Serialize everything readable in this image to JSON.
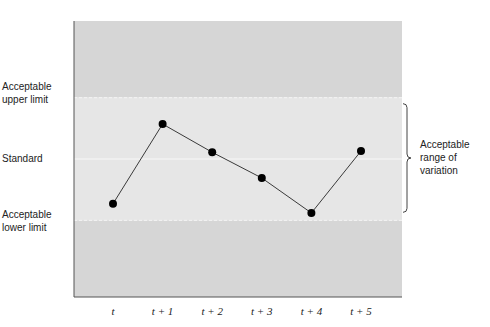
{
  "chart_data": {
    "type": "line",
    "title": "",
    "xlabel": "",
    "ylabel": "",
    "categories": [
      "t",
      "t + 1",
      "t + 2",
      "t + 3",
      "t + 4",
      "t + 5"
    ],
    "series": [
      {
        "name": "Measured performance",
        "values": [
          -0.73,
          0.57,
          0.11,
          -0.31,
          -0.88,
          0.13
        ]
      }
    ],
    "ylim": [
      -2.25,
      2.25
    ],
    "reference_lines": [
      {
        "name": "Acceptable upper limit",
        "value": 1,
        "style": "dashed"
      },
      {
        "name": "Standard",
        "value": 0,
        "style": "solid"
      },
      {
        "name": "Acceptable lower limit",
        "value": -1,
        "style": "dashed"
      }
    ],
    "left_labels": {
      "upper": [
        "Acceptable",
        "upper limit"
      ],
      "standard": [
        "Standard"
      ],
      "lower": [
        "Acceptable",
        "lower limit"
      ]
    },
    "annotation": {
      "text": [
        "Acceptable",
        "range of",
        "variation"
      ],
      "spans": [
        -1,
        1
      ],
      "marker": "right curly brace"
    },
    "grid": false,
    "legend": "none",
    "colors": {
      "outer_band": "#d6d6d6",
      "inner_band": "#e6e6e6",
      "limit_line": "#f4f4f4",
      "standard_line": "#f8f8f8",
      "series_line": "#3a3a3a",
      "marker": "#000000",
      "axis": "#555555"
    }
  }
}
